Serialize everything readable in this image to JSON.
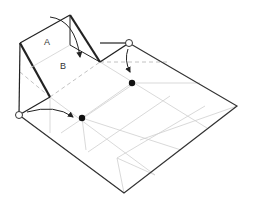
{
  "diagram": {
    "type": "origami-fold-step",
    "labels": {
      "a": "A",
      "b": "B"
    },
    "colors": {
      "outline": "#333333",
      "thick": "#222222",
      "crease": "#cccccc",
      "dashed": "#bbbbbb",
      "dot": "#111111"
    },
    "markers": {
      "circles": [
        {
          "x": 19,
          "y": 115
        },
        {
          "x": 129,
          "y": 43
        }
      ],
      "dots": [
        {
          "x": 82,
          "y": 118
        },
        {
          "x": 132,
          "y": 83
        }
      ]
    },
    "arrows": [
      {
        "from": "circle-left",
        "to": "dot-left"
      },
      {
        "from": "circle-right",
        "to": "dot-right"
      },
      {
        "from": "flap-a-top",
        "to": "flap-b"
      }
    ]
  }
}
